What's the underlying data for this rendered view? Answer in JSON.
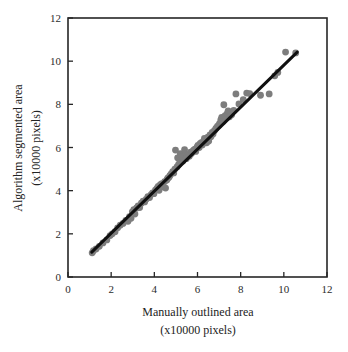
{
  "chart_data": {
    "type": "scatter",
    "title": "",
    "xlabel": "Manually outlined area",
    "xlabel_units": "(x10000 pixels)",
    "ylabel": "Algorithm segmented area",
    "ylabel_units": "(x10000 pixels)",
    "xlim": [
      0,
      12
    ],
    "ylim": [
      0,
      12
    ],
    "xticks": [
      0,
      2,
      4,
      6,
      8,
      10,
      12
    ],
    "yticks": [
      0,
      2,
      4,
      6,
      8,
      10,
      12
    ],
    "xtick_labels": [
      "0",
      "2",
      "4",
      "6",
      "8",
      "10",
      "12"
    ],
    "ytick_labels": [
      "0",
      "2",
      "4",
      "6",
      "8",
      "10",
      "12"
    ],
    "grid": false,
    "legend": null,
    "marker_color": "#7d7d7d",
    "line_color": "#101010",
    "frame_color": "#262626",
    "background": "#ffffff",
    "series": [
      {
        "name": "Area comparison",
        "type": "scatter",
        "points": [
          [
            1.12,
            1.12
          ],
          [
            1.18,
            1.22
          ],
          [
            1.3,
            1.3
          ],
          [
            1.45,
            1.42
          ],
          [
            1.62,
            1.58
          ],
          [
            1.8,
            1.72
          ],
          [
            1.95,
            1.92
          ],
          [
            2.05,
            2.0
          ],
          [
            2.18,
            2.1
          ],
          [
            2.3,
            2.28
          ],
          [
            2.42,
            2.4
          ],
          [
            2.55,
            2.48
          ],
          [
            2.68,
            2.62
          ],
          [
            2.78,
            2.58
          ],
          [
            2.85,
            2.8
          ],
          [
            2.92,
            2.72
          ],
          [
            2.98,
            3.02
          ],
          [
            3.05,
            3.12
          ],
          [
            3.1,
            2.92
          ],
          [
            3.18,
            3.2
          ],
          [
            3.25,
            3.3
          ],
          [
            3.32,
            3.22
          ],
          [
            3.4,
            3.42
          ],
          [
            3.48,
            3.52
          ],
          [
            3.55,
            3.48
          ],
          [
            3.62,
            3.6
          ],
          [
            3.7,
            3.72
          ],
          [
            3.78,
            3.68
          ],
          [
            3.85,
            3.82
          ],
          [
            3.92,
            3.9
          ],
          [
            3.98,
            3.86
          ],
          [
            4.05,
            4.02
          ],
          [
            4.12,
            4.1
          ],
          [
            4.18,
            4.2
          ],
          [
            4.22,
            4.02
          ],
          [
            4.28,
            4.28
          ],
          [
            4.35,
            4.32
          ],
          [
            4.42,
            4.18
          ],
          [
            4.48,
            4.42
          ],
          [
            4.52,
            4.12
          ],
          [
            4.58,
            4.5
          ],
          [
            4.62,
            4.58
          ],
          [
            4.68,
            4.62
          ],
          [
            4.72,
            4.7
          ],
          [
            4.78,
            4.78
          ],
          [
            4.85,
            4.88
          ],
          [
            4.9,
            4.82
          ],
          [
            4.95,
            5.0
          ],
          [
            4.98,
            5.88
          ],
          [
            5.05,
            5.1
          ],
          [
            5.08,
            5.52
          ],
          [
            5.12,
            5.2
          ],
          [
            5.18,
            5.3
          ],
          [
            5.2,
            5.72
          ],
          [
            5.25,
            5.42
          ],
          [
            5.28,
            5.58
          ],
          [
            5.32,
            5.38
          ],
          [
            5.38,
            5.5
          ],
          [
            5.4,
            5.9
          ],
          [
            5.45,
            5.62
          ],
          [
            5.48,
            5.48
          ],
          [
            5.52,
            5.58
          ],
          [
            5.58,
            5.68
          ],
          [
            5.62,
            5.6
          ],
          [
            5.68,
            5.78
          ],
          [
            5.72,
            5.72
          ],
          [
            5.78,
            5.82
          ],
          [
            5.82,
            5.88
          ],
          [
            5.88,
            5.92
          ],
          [
            5.92,
            5.82
          ],
          [
            5.98,
            6.02
          ],
          [
            6.02,
            6.1
          ],
          [
            6.08,
            6.0
          ],
          [
            6.12,
            6.18
          ],
          [
            6.18,
            6.22
          ],
          [
            6.22,
            6.12
          ],
          [
            6.28,
            6.3
          ],
          [
            6.32,
            6.42
          ],
          [
            6.38,
            6.38
          ],
          [
            6.42,
            6.22
          ],
          [
            6.48,
            6.48
          ],
          [
            6.52,
            6.3
          ],
          [
            6.58,
            6.58
          ],
          [
            6.62,
            6.5
          ],
          [
            6.68,
            6.7
          ],
          [
            6.72,
            6.62
          ],
          [
            6.78,
            6.78
          ],
          [
            6.85,
            6.88
          ],
          [
            6.92,
            6.98
          ],
          [
            6.98,
            7.02
          ],
          [
            7.02,
            7.1
          ],
          [
            7.08,
            7.28
          ],
          [
            7.12,
            7.4
          ],
          [
            7.18,
            7.2
          ],
          [
            7.22,
            7.98
          ],
          [
            7.28,
            7.48
          ],
          [
            7.32,
            7.38
          ],
          [
            7.38,
            7.58
          ],
          [
            7.42,
            7.7
          ],
          [
            7.48,
            7.42
          ],
          [
            7.52,
            7.62
          ],
          [
            7.58,
            7.52
          ],
          [
            7.68,
            7.72
          ],
          [
            7.78,
            8.48
          ],
          [
            7.92,
            8.02
          ],
          [
            8.12,
            8.22
          ],
          [
            8.28,
            8.52
          ],
          [
            8.42,
            8.5
          ],
          [
            8.92,
            8.42
          ],
          [
            9.32,
            8.48
          ],
          [
            9.58,
            9.32
          ],
          [
            9.72,
            9.48
          ],
          [
            10.08,
            10.42
          ],
          [
            10.55,
            10.38
          ]
        ]
      },
      {
        "name": "Regression line",
        "type": "line",
        "points": [
          [
            1.1,
            1.15
          ],
          [
            10.62,
            10.42
          ]
        ]
      }
    ]
  },
  "axes": {
    "x_title": "Manually outlined area",
    "x_subtitle": "(x10000 pixels)",
    "y_title": "Algorithm segmented area",
    "y_subtitle": "(x10000 pixels)"
  }
}
